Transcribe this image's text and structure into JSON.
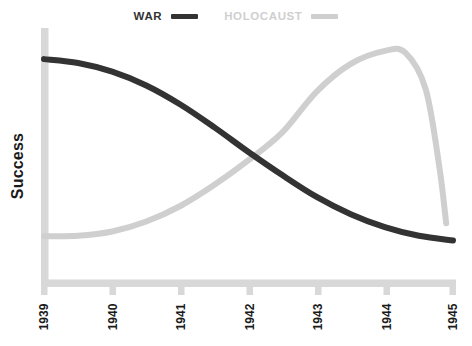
{
  "figure": {
    "legend": [
      {
        "name": "WAR",
        "label": "WAR",
        "color": "#333333"
      },
      {
        "name": "HOLOCAUST",
        "label": "HOLOCAUST",
        "color": "#cfcfcf"
      }
    ],
    "ylabel": "Success",
    "caption": "",
    "axis_color": "#d8d8d8",
    "background": "#ffffff"
  },
  "chart_data": {
    "type": "line",
    "title": "",
    "subtitle": "",
    "xlabel": "",
    "ylabel": "Success",
    "x": [
      1939,
      1940,
      1941,
      1942,
      1943,
      1944,
      1945
    ],
    "tick_labels": [
      "1939",
      "1940",
      "1941",
      "1942",
      "1943",
      "1944",
      "1945"
    ],
    "xlim": [
      1939,
      1945
    ],
    "ylim": [
      0,
      1
    ],
    "y_axis_ticks": [],
    "grid": false,
    "legend_position": "top-center",
    "series": [
      {
        "name": "WAR",
        "label": "WAR",
        "color": "#333333",
        "linewidth": 6,
        "categories": [
          1939,
          1940,
          1941,
          1942,
          1943,
          1944,
          1945
        ],
        "values": [
          0.93,
          0.87,
          0.72,
          0.5,
          0.29,
          0.15,
          0.09
        ],
        "points": [
          {
            "x": 1939.0,
            "y": 0.93
          },
          {
            "x": 1939.5,
            "y": 0.912
          },
          {
            "x": 1940.0,
            "y": 0.872
          },
          {
            "x": 1940.5,
            "y": 0.808
          },
          {
            "x": 1941.0,
            "y": 0.72
          },
          {
            "x": 1941.5,
            "y": 0.614
          },
          {
            "x": 1942.0,
            "y": 0.5
          },
          {
            "x": 1942.5,
            "y": 0.392
          },
          {
            "x": 1943.0,
            "y": 0.292
          },
          {
            "x": 1943.5,
            "y": 0.212
          },
          {
            "x": 1944.0,
            "y": 0.152
          },
          {
            "x": 1944.5,
            "y": 0.112
          },
          {
            "x": 1945.0,
            "y": 0.09
          }
        ]
      },
      {
        "name": "HOLOCAUST",
        "label": "HOLOCAUST",
        "color": "#cfcfcf",
        "linewidth": 6,
        "categories": [
          1939,
          1940,
          1941,
          1942,
          1943,
          1944,
          1945
        ],
        "values": [
          0.11,
          0.13,
          0.25,
          0.46,
          0.78,
          0.97,
          0.17
        ],
        "points": [
          {
            "x": 1939.0,
            "y": 0.11
          },
          {
            "x": 1939.5,
            "y": 0.112
          },
          {
            "x": 1940.0,
            "y": 0.132
          },
          {
            "x": 1940.5,
            "y": 0.178
          },
          {
            "x": 1941.0,
            "y": 0.25
          },
          {
            "x": 1941.5,
            "y": 0.348
          },
          {
            "x": 1942.0,
            "y": 0.462
          },
          {
            "x": 1942.5,
            "y": 0.592
          },
          {
            "x": 1943.0,
            "y": 0.78
          },
          {
            "x": 1943.5,
            "y": 0.908
          },
          {
            "x": 1944.0,
            "y": 0.968
          },
          {
            "x": 1944.3,
            "y": 0.96
          },
          {
            "x": 1944.6,
            "y": 0.79
          },
          {
            "x": 1944.8,
            "y": 0.43
          },
          {
            "x": 1944.9,
            "y": 0.17
          }
        ]
      }
    ],
    "annotations": [
      {
        "name": "crossover",
        "x": 1942.2,
        "y": 0.47,
        "text": ""
      }
    ]
  }
}
